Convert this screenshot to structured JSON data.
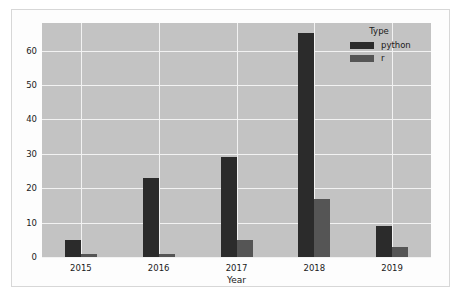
{
  "chart_data": {
    "type": "bar",
    "title": "",
    "subtitle": "",
    "xlabel": "Year",
    "ylabel": "",
    "categories": [
      "2015",
      "2016",
      "2017",
      "2018",
      "2019"
    ],
    "series": [
      {
        "name": "python",
        "color": "#2b2b2b",
        "values": [
          5,
          23,
          29,
          65,
          9
        ]
      },
      {
        "name": "r",
        "color": "#555555",
        "values": [
          1,
          1,
          5,
          17,
          3
        ]
      }
    ],
    "legend": {
      "title": "Type",
      "position": "top-right",
      "entries": [
        {
          "label": "python",
          "color": "#2b2b2b"
        },
        {
          "label": "r",
          "color": "#555555"
        }
      ]
    },
    "ylim": [
      0,
      68
    ],
    "yticks": [
      0,
      10,
      20,
      30,
      40,
      50,
      60
    ],
    "ytick_labels": [
      "0",
      "10",
      "20",
      "30",
      "40",
      "50",
      "60"
    ],
    "xtick_labels": [
      "2015",
      "2016",
      "2017",
      "2018",
      "2019"
    ],
    "grid": true,
    "grid_color": "#f2f2f2",
    "plot_background": "#c3c3c3",
    "figure_background": "#fdfdfd"
  }
}
